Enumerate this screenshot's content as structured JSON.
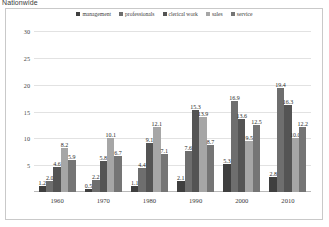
{
  "caption": "Nationwide",
  "chart_data": {
    "type": "bar",
    "title": "Nationwide",
    "xlabel": "",
    "ylabel": "",
    "grid": true,
    "legend_position": "top-center",
    "ylim": [
      0,
      30
    ],
    "yticks": [
      "5",
      "10",
      "15",
      "20",
      "25",
      "30"
    ],
    "ytick_values": [
      5,
      10,
      15,
      20,
      25,
      30
    ],
    "categories": [
      "1960",
      "1970",
      "1980",
      "1990",
      "2000",
      "2010"
    ],
    "series": [
      {
        "name": "management",
        "color": "#3f3f3f",
        "values": [
          1.2,
          0.5,
          1.1,
          2.1,
          5.3,
          2.8
        ],
        "labels": [
          "1.2",
          "0.5",
          "1.1",
          "2.1",
          "5.3",
          "2.8"
        ]
      },
      {
        "name": "professionals",
        "color": "#6e6e6e",
        "values": [
          2.0,
          2.2,
          4.4,
          7.6,
          16.9,
          19.4
        ],
        "labels": [
          "2.0",
          "2.2",
          "4.4",
          "7.6",
          "16.9",
          "19.4"
        ]
      },
      {
        "name": "clerical work",
        "color": "#545454",
        "values": [
          4.6,
          5.8,
          9.1,
          15.3,
          13.6,
          16.3
        ],
        "labels": [
          "4.6",
          "5.8",
          "9.1",
          "15.3",
          "13.6",
          "16.3"
        ]
      },
      {
        "name": "sales",
        "color": "#a6a6a6",
        "values": [
          8.2,
          10.1,
          12.1,
          13.9,
          9.5,
          10.0
        ],
        "labels": [
          "8.2",
          "10.1",
          "12.1",
          "13.9",
          "9.5",
          "10.0"
        ]
      },
      {
        "name": "service",
        "color": "#757575",
        "values": [
          5.9,
          6.7,
          7.1,
          8.7,
          12.5,
          12.2
        ],
        "labels": [
          "5.9",
          "6.7",
          "7.1",
          "8.7",
          "12.5",
          "12.2"
        ]
      }
    ]
  }
}
